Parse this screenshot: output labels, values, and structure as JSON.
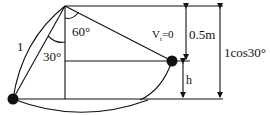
{
  "diagram": {
    "labels": {
      "length": "1",
      "angle_60": "60°",
      "angle_30": "30°",
      "velocity": "V",
      "velocity_sub": "t",
      "velocity_eq": "=0",
      "height_05": "0.5m",
      "height_h": "h",
      "height_total": "1cos30°"
    },
    "colors": {
      "stroke": "#111111",
      "background": "#ffffff"
    }
  }
}
